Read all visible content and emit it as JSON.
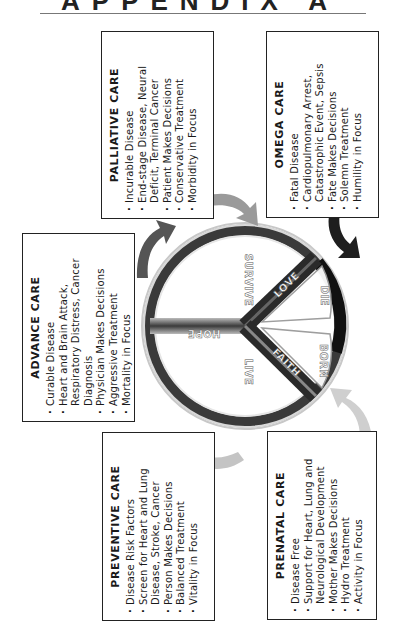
{
  "header": {
    "title": "APPENDIX A"
  },
  "boxes": {
    "palliative": {
      "title": "PALLIATIVE CARE",
      "items": [
        "Incurable Disease",
        "End-stage Disease, Neural Deficit, Terminal Cancer",
        "Patient Makes Decisions",
        "Conservative Treatment",
        "Morbidity in Focus"
      ]
    },
    "omega": {
      "title": "OMEGA CARE",
      "items": [
        "Fatal Disease",
        "Cardiopulmonary Arrest, Catastrophic Event, Sepsis",
        "Fate Makes Decisions",
        "Solemn Treatment",
        "Humility in Focus"
      ]
    },
    "advance": {
      "title": "ADVANCE CARE",
      "items": [
        "Curable Disease",
        "Heart and Brain Attack, Respiratory Distress, Cancer Diagnosis",
        "Physician Makes Decisions",
        "Aggressive Treatment",
        "Mortality in Focus"
      ]
    },
    "preventive": {
      "title": "PREVENTIVE CARE",
      "items": [
        "Disease Risk Factors",
        "Screen for Heart and Lung Disease, Stroke, Cancer",
        "Person Makes Decisions",
        "Balanced Treatment",
        "Vitality in Focus"
      ]
    },
    "prenatal": {
      "title": "PRENATAL CARE",
      "items": [
        "Disease Free",
        "Support for Heart, Lung and Neurological Development",
        "Mother Makes Decisions",
        "Hydro Treatment",
        "Activity in Focus"
      ]
    }
  },
  "peace_symbol": {
    "labels": {
      "hope": "HOPE",
      "survive": "SURVIVE",
      "live": "LIVE",
      "love": "LOVE",
      "faith": "FAITH",
      "die": "DIE",
      "born": "BORN"
    }
  },
  "colors": {
    "ring_dark": "#2a2a2a",
    "ring_light": "#d9d9d9",
    "arrow_dark": "#1e1e1e",
    "arrow_mid": "#555555",
    "arrow_light": "#c8c8c8",
    "border": "#222222"
  }
}
